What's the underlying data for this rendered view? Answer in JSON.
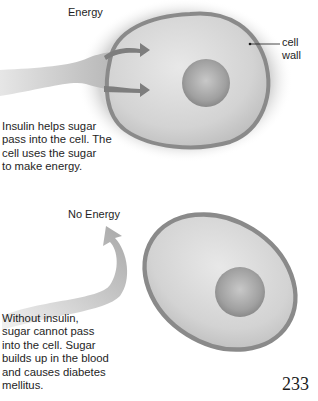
{
  "top_panel": {
    "title": "Energy",
    "label_cell_wall": [
      "cell",
      "wall"
    ],
    "caption": [
      "Insulin helps sugar",
      "pass into the cell. The",
      "cell uses the sugar",
      "to make energy."
    ]
  },
  "bottom_panel": {
    "title": "No Energy",
    "caption": [
      "Without insulin,",
      "sugar cannot pass",
      "into the cell. Sugar",
      "builds up in the blood",
      "and causes diabetes",
      "mellitus."
    ]
  },
  "page_number": "233",
  "colors": {
    "cell_wall": "#8a8a8a",
    "cytoplasm": "#d4d4d4",
    "nucleus": "#9a9a9a",
    "arrow": "#7e7e7e",
    "sugar_stream": "#c8c8c8"
  }
}
